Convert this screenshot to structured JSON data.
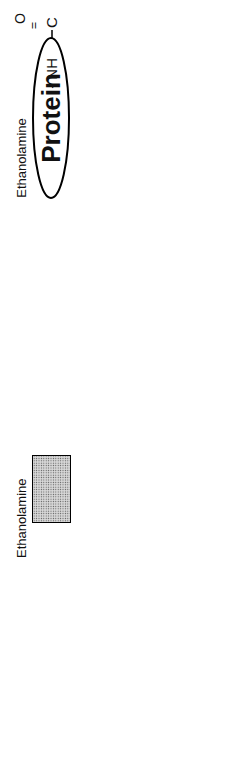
{
  "diagram": {
    "protein": {
      "label": "Protein"
    },
    "amide": {
      "carbonyl": "O",
      "carbon": "C",
      "linker": "- NH"
    },
    "ethanolamine": {
      "label": "Ethanolamine",
      "formula_ch2a": "CH",
      "sub_a": "2",
      "formula_ch2b": "CH",
      "sub_b": "2"
    },
    "phosphate1": {
      "o_left": "O-",
      "p": "P",
      "o_top": "O",
      "o_top_charge": "-",
      "o_right": "O",
      "double_o": "= O",
      "dash1": "-",
      "dash2": "-"
    },
    "sugars": [
      {
        "text": "Manα1",
        "link_after": "2",
        "label": "Mannose"
      },
      {
        "text": "Manα1",
        "link_after": "6",
        "label": "Mannose"
      },
      {
        "text": "Manα1",
        "link_after": "4",
        "label": "Mannose"
      },
      {
        "text": "GlcNH",
        "sub": "2",
        "suffix": "α1",
        "label": "Glucosamine"
      }
    ],
    "glycosidic_o": "O",
    "inositol": {
      "label": "Inositol",
      "pos6": "6",
      "pos1": "1",
      "ring_o": "O"
    },
    "phosphate2": {
      "p": "P",
      "double_o": "O",
      "o_minus": "O",
      "charge": "-",
      "o_link": "O"
    },
    "glycerol": {
      "row1": "H₂-C-O-C",
      "row2": "H-C-O-C",
      "row3": "-O-CH₂",
      "r1": "R",
      "r1_sub": "1",
      "r2": "R",
      "r2_sub": "2",
      "carbonyl_o1": "O",
      "carbonyl_o2": "O"
    }
  }
}
